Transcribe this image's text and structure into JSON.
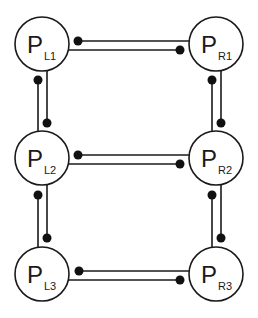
{
  "diagram": {
    "nodes": [
      {
        "id": "PL1",
        "main": "P",
        "sub": "L1",
        "cx": 42,
        "cy": 44
      },
      {
        "id": "PR1",
        "main": "P",
        "sub": "R1",
        "cx": 216,
        "cy": 44
      },
      {
        "id": "PL2",
        "main": "P",
        "sub": "L2",
        "cx": 42,
        "cy": 158
      },
      {
        "id": "PR2",
        "main": "P",
        "sub": "R2",
        "cx": 216,
        "cy": 158
      },
      {
        "id": "PL3",
        "main": "P",
        "sub": "L3",
        "cx": 42,
        "cy": 274
      },
      {
        "id": "PR3",
        "main": "P",
        "sub": "R3",
        "cx": 216,
        "cy": 274
      }
    ],
    "edges": [
      {
        "from": "PL1",
        "to": "PR1",
        "orientation": "horizontal"
      },
      {
        "from": "PL2",
        "to": "PR2",
        "orientation": "horizontal"
      },
      {
        "from": "PL3",
        "to": "PR3",
        "orientation": "horizontal"
      },
      {
        "from": "PL1",
        "to": "PL2",
        "orientation": "vertical"
      },
      {
        "from": "PL2",
        "to": "PL3",
        "orientation": "vertical"
      },
      {
        "from": "PR1",
        "to": "PR2",
        "orientation": "vertical"
      },
      {
        "from": "PR2",
        "to": "PR3",
        "orientation": "vertical"
      }
    ],
    "colors": {
      "stroke": "#1a1a1a",
      "dot": "#111111",
      "background": "#ffffff"
    }
  }
}
